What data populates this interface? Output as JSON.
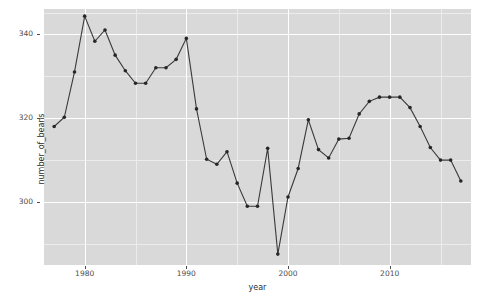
{
  "chart_data": {
    "type": "line",
    "title": "",
    "subtitle": "",
    "xlabel": "year",
    "ylabel": "number_of_beans",
    "xlim": [
      1976,
      2018
    ],
    "ylim": [
      285,
      346
    ],
    "x_ticks": [
      1980,
      1990,
      2000,
      2010
    ],
    "x_tick_labels": [
      "1980",
      "1990",
      "2000",
      "2010"
    ],
    "y_ticks": [
      300,
      320,
      340
    ],
    "y_tick_labels": [
      "300",
      "320",
      "340"
    ],
    "grid": "major-and-minor-white-on-grey",
    "legend": "none",
    "marker": "filled-circle",
    "line_color": "#3a3a3a",
    "point_color": "#262626",
    "panel_color": "#d9d9d9",
    "gridline_color": "#ffffff",
    "series": [
      {
        "name": "number_of_beans",
        "x": [
          1977,
          1978,
          1979,
          1980,
          1981,
          1982,
          1983,
          1984,
          1985,
          1986,
          1987,
          1988,
          1989,
          1990,
          1991,
          1992,
          1993,
          1994,
          1995,
          1996,
          1997,
          1998,
          1999,
          2000,
          2001,
          2002,
          2003,
          2004,
          2005,
          2006,
          2007,
          2008,
          2009,
          2010,
          2011,
          2012,
          2013,
          2014,
          2015,
          2016,
          2017
        ],
        "values": [
          318.0,
          320.2,
          331.0,
          344.3,
          338.3,
          341.0,
          335.0,
          331.3,
          328.3,
          328.3,
          332.0,
          332.0,
          334.0,
          339.0,
          322.2,
          310.2,
          309.0,
          312.0,
          304.5,
          299.0,
          299.0,
          312.8,
          287.6,
          301.2,
          308.0,
          319.6,
          312.5,
          310.5,
          315.0,
          315.2,
          321.0,
          324.0,
          325.0,
          325.0,
          325.0,
          322.5,
          318.0,
          313.0,
          310.0,
          310.0,
          305.0
        ]
      }
    ]
  },
  "axes": {
    "y_title": "number_of_beans",
    "x_title": "year"
  }
}
